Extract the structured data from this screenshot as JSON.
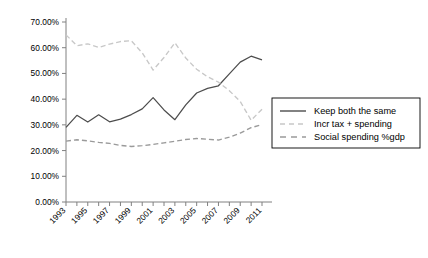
{
  "chart_data": {
    "type": "line",
    "title": "",
    "subtitle": "",
    "xlabel": "",
    "ylabel": "",
    "grid": false,
    "legend_position": "right",
    "ylim": [
      0,
      0.7
    ],
    "ytick_labels": [
      "0.00%",
      "10.00%",
      "20.00%",
      "30.00%",
      "40.00%",
      "50.00%",
      "60.00%",
      "70.00%"
    ],
    "ytick_values": [
      0,
      0.1,
      0.2,
      0.3,
      0.4,
      0.5,
      0.6,
      0.7
    ],
    "x": [
      1993,
      1994,
      1995,
      1996,
      1997,
      1998,
      1999,
      2000,
      2001,
      2002,
      2003,
      2004,
      2005,
      2006,
      2007,
      2008,
      2009,
      2010,
      2011
    ],
    "xtick_labels": [
      "1993",
      "1995",
      "1997",
      "1999",
      "2001",
      "2003",
      "2005",
      "2007",
      "2009",
      "2011"
    ],
    "xtick_values": [
      1993,
      1995,
      1997,
      1999,
      2001,
      2003,
      2005,
      2007,
      2009,
      2011
    ],
    "xlim": [
      1993,
      2011
    ],
    "series": [
      {
        "name": "Keep both the same",
        "color": "#4d4d4d",
        "style": "solid",
        "values": [
          0.29,
          0.337,
          0.311,
          0.339,
          0.312,
          0.322,
          0.34,
          0.362,
          0.406,
          0.358,
          0.32,
          0.378,
          0.424,
          0.442,
          0.452,
          0.498,
          0.544,
          0.567,
          0.553
        ]
      },
      {
        "name": "Incr tax + spending",
        "color": "#c8c8c8",
        "style": "dashed",
        "values": [
          0.65,
          0.608,
          0.615,
          0.601,
          0.614,
          0.624,
          0.627,
          0.58,
          0.513,
          0.562,
          0.619,
          0.56,
          0.516,
          0.487,
          0.466,
          0.433,
          0.391,
          0.318,
          0.361
        ]
      },
      {
        "name": "Social spending %gdp",
        "color": "#9a9a9a",
        "style": "dashed",
        "values": [
          0.237,
          0.242,
          0.238,
          0.232,
          0.228,
          0.22,
          0.216,
          0.219,
          0.224,
          0.23,
          0.236,
          0.243,
          0.247,
          0.244,
          0.241,
          0.252,
          0.268,
          0.289,
          0.301
        ]
      }
    ]
  },
  "legend": {
    "items": [
      {
        "label": "Keep both the same"
      },
      {
        "label": "Incr tax + spending"
      },
      {
        "label": "Social spending %gdp"
      }
    ]
  }
}
